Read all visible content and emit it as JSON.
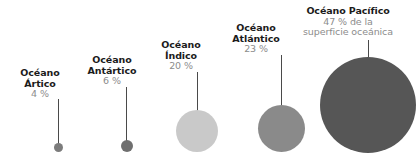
{
  "chart_data": {
    "type": "bubble",
    "title": "",
    "unit": "%",
    "background_color": "#ffffff",
    "categories": [
      "Océano Ártico",
      "Océano Antártico",
      "Océano Índico",
      "Océano Atlántico",
      "Océano Pacífico"
    ],
    "values": [
      4,
      6,
      20,
      23,
      47
    ],
    "value_labels": [
      "4 %",
      "6 %",
      "20 %",
      "23 %",
      "47 % de la"
    ],
    "annotations": [
      "superficie oceánica"
    ],
    "series": [
      {
        "name": "Superficie oceánica",
        "values": [
          4,
          6,
          20,
          23,
          47
        ]
      }
    ],
    "bubbles": [
      {
        "id": "artico",
        "name": "Océano Ártico",
        "value_label": "4 %",
        "value": 4,
        "color": "#7c7c7c",
        "diameter_px": 9
      },
      {
        "id": "antartico",
        "name": "Océano Antártico",
        "value_label": "6 %",
        "value": 6,
        "color": "#6f6f6f",
        "diameter_px": 12
      },
      {
        "id": "indico",
        "name": "Océano Índico",
        "value_label": "20 %",
        "value": 20,
        "color": "#c9c9c9",
        "diameter_px": 42
      },
      {
        "id": "atlantico",
        "name": "Océano Atlántico",
        "value_label": "23 %",
        "value": 23,
        "color": "#8a8a8a",
        "diameter_px": 47
      },
      {
        "id": "pacifico",
        "name": "Océano Pacífico",
        "value_label": "47 % de la",
        "value": 47,
        "color": "#565656",
        "diameter_px": 96
      }
    ],
    "legend": "none",
    "grid": false,
    "xlabel": "",
    "ylabel": ""
  },
  "labels": {
    "artico": {
      "name": "Océano",
      "name2": "Ártico",
      "pct": "4 %"
    },
    "antartico": {
      "name": "Océano",
      "name2": "Antártico",
      "pct": "6 %"
    },
    "indico": {
      "name": "Océano",
      "name2": "Índico",
      "pct": "20 %"
    },
    "atlantico": {
      "name": "Océano",
      "name2": "Atlántico",
      "pct": "23 %"
    },
    "pacifico": {
      "name": "Océano Pacífico",
      "pct": "47 % de la",
      "pct2": "superficie oceánica"
    }
  }
}
